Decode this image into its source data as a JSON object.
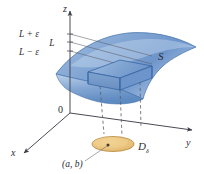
{
  "figure": {
    "caption_title": "Epsilon-delta limit of a function of two variables",
    "background_color": "#ffffff",
    "axes": {
      "z_label": "z",
      "y_label": "y",
      "x_label": "x",
      "origin_label": "0",
      "axis_color": "#4a4a55"
    },
    "tick_labels": {
      "upper": "L + ε",
      "middle": "L",
      "lower": "L − ε"
    },
    "surface": {
      "label": "S",
      "fill_light": "#cddcf0",
      "fill_mid": "#8fb0db",
      "fill_dark": "#4f7fbd",
      "edge_color": "#3a6ba8"
    },
    "slab": {
      "label": "",
      "edge_color": "#2f5f9e",
      "face_color": "#7ba3d4"
    },
    "disk": {
      "label": "D",
      "label_sub": "δ",
      "center_label": "(a, b)",
      "fill_color": "#e8c178",
      "edge_color": "#b5873a",
      "center_dot_color": "#5a4a2a"
    },
    "dashed_lines": {
      "color": "#5c5c66",
      "count": 3
    },
    "leader_line": {
      "color": "#6b6b75"
    }
  }
}
